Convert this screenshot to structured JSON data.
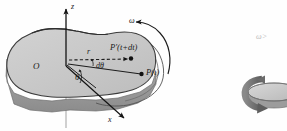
{
  "figure": {
    "axes": {
      "z_label": "z",
      "x_label": "x"
    },
    "origin_label": "O",
    "radius_label": "r",
    "angle_label": "θ",
    "angle_increment_label": "dθ",
    "angular_velocity_label": "ω",
    "points": [
      {
        "name": "point-p-t",
        "label": "P(t)"
      },
      {
        "name": "point-p-prime",
        "label_italic": "P′(",
        "label_upright_t": "t",
        "label_plus": "+",
        "label_dt": "d",
        "label_t2": "t",
        "label_close": ")",
        "label": "P′(t+dt)"
      }
    ],
    "inset": {
      "omega_condition": "ω>"
    },
    "colors": {
      "body_fill": "#c9c9c9",
      "body_edge": "#9a9a9a",
      "body_side": "#9b9b9b",
      "outline": "#3a3a3a",
      "axis": "#1a1a1a",
      "axis_hidden": "#b5b5b5",
      "disk_top": "#c9c9c9",
      "disk_side": "#8f8f8f",
      "arrow_gray": "#6f6f6f",
      "faint_text": "#bdbdbd"
    }
  }
}
